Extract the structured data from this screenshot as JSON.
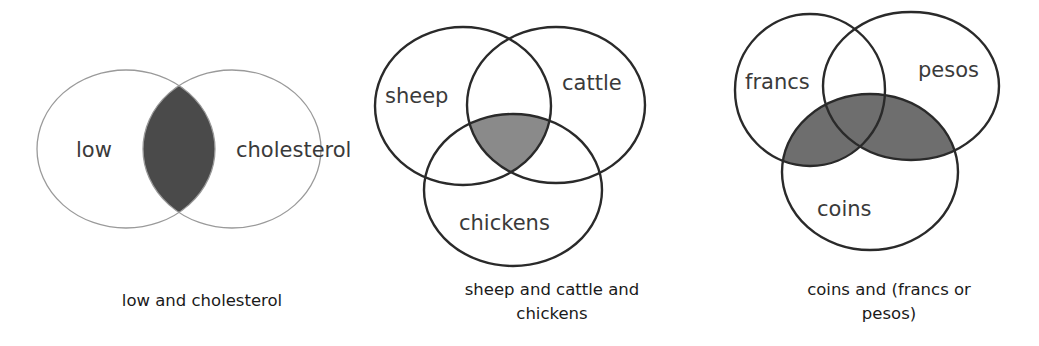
{
  "diagrams": [
    {
      "id": "low-and-cholesterol",
      "sets": [
        "low",
        "cholesterol"
      ],
      "labels": {
        "left": "low",
        "right": "cholesterol"
      },
      "shaded_region": "low ∩ cholesterol",
      "caption_lines": [
        "low and cholesterol"
      ],
      "style": {
        "stroke": "#9a9a9a",
        "fill_shade": "#4a4a4a"
      }
    },
    {
      "id": "sheep-and-cattle-and-chickens",
      "sets": [
        "sheep",
        "cattle",
        "chickens"
      ],
      "labels": {
        "top_left": "sheep",
        "top_right": "cattle",
        "bottom": "chickens"
      },
      "shaded_region": "sheep ∩ cattle ∩ chickens",
      "caption_lines": [
        "sheep and cattle and",
        "chickens"
      ],
      "style": {
        "stroke": "#2a2a2a",
        "fill_shade": "#8a8a8a"
      }
    },
    {
      "id": "coins-and-francs-or-pesos",
      "sets": [
        "francs",
        "pesos",
        "coins"
      ],
      "labels": {
        "top_left": "francs",
        "top_right": "pesos",
        "bottom": "coins"
      },
      "shaded_region": "coins ∩ (francs ∪ pesos)",
      "caption_lines": [
        "coins and (francs or",
        "pesos)"
      ],
      "style": {
        "stroke": "#2a2a2a",
        "fill_shade": "#6e6e6e"
      }
    }
  ]
}
